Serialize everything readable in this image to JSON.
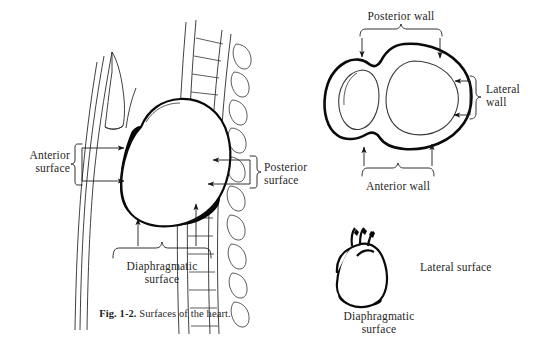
{
  "figure": {
    "caption_prefix": "Fig. 1-2.",
    "caption_text": "Surfaces of the heart.",
    "background_color": "#ffffff",
    "ink_color": "#0a0a0a"
  },
  "panel_left": {
    "name": "sagittal-thorax-section",
    "labels": {
      "anterior_line1": "Anterior",
      "anterior_line2": "surface",
      "posterior_line1": "Posterior",
      "posterior_line2": "surface",
      "diaphragmatic_line1": "Diaphragmatic",
      "diaphragmatic_line2": "surface"
    }
  },
  "panel_top_right": {
    "name": "ventricle-cross-section",
    "labels": {
      "posterior_wall": "Posterior wall",
      "lateral_wall_line1": "Lateral",
      "lateral_wall_line2": "wall",
      "anterior_wall": "Anterior wall"
    }
  },
  "panel_bottom_right": {
    "name": "heart-anterior-view",
    "labels": {
      "lateral_surface": "Lateral surface",
      "diaphragmatic_line1": "Diaphragmatic",
      "diaphragmatic_line2": "surface"
    }
  }
}
